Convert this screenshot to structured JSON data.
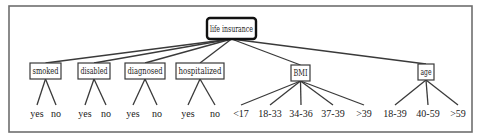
{
  "diagram": {
    "type": "tree",
    "root": {
      "label": "life insurance",
      "children": [
        {
          "label": "smoked",
          "leaves": [
            "yes",
            "no"
          ]
        },
        {
          "label": "disabled",
          "leaves": [
            "yes",
            "no"
          ]
        },
        {
          "label": "diagnosed",
          "leaves": [
            "yes",
            "no"
          ]
        },
        {
          "label": "hospitalized",
          "leaves": [
            "yes",
            "no"
          ]
        },
        {
          "label": "BMI",
          "leaves": [
            "<17",
            "18-33",
            "34-36",
            "37-39",
            ">39"
          ]
        },
        {
          "label": "age",
          "leaves": [
            "18-39",
            "40-59",
            ">59"
          ]
        }
      ]
    }
  }
}
